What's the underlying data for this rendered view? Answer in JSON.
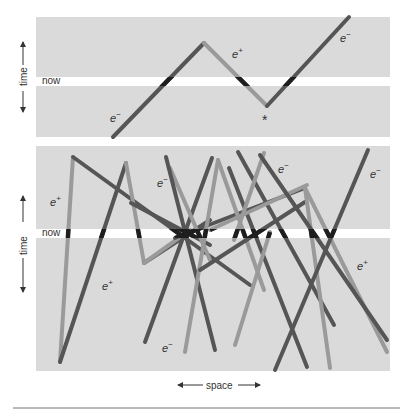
{
  "colors": {
    "panel_bg": "#dadada",
    "now_band": "#ffffff",
    "electron": "#555555",
    "positron": "#9a9a9a",
    "highlight": "#1e1e1e",
    "text": "#333333",
    "rule": "#777777"
  },
  "top_panel": {
    "axis_label": "time",
    "now_label": "now",
    "labels": [
      {
        "text": "e",
        "sup": "−",
        "x": 110,
        "y": 122
      },
      {
        "text": "e",
        "sup": "+",
        "x": 232,
        "y": 58
      },
      {
        "text": "e",
        "sup": "−",
        "x": 340,
        "y": 42
      }
    ],
    "annotation_marker": "*",
    "paths": [
      {
        "type": "electron",
        "points": [
          [
            113,
            137
          ],
          [
            204,
            43
          ]
        ]
      },
      {
        "type": "positron",
        "points": [
          [
            204,
            43
          ],
          [
            267,
            106
          ]
        ]
      },
      {
        "type": "electron",
        "points": [
          [
            267,
            106
          ],
          [
            349,
            17
          ]
        ]
      }
    ]
  },
  "bottom_panel": {
    "axis_label": "time",
    "now_label": "now",
    "labels": [
      {
        "text": "e",
        "sup": "+",
        "x": 50,
        "y": 206
      },
      {
        "text": "e",
        "sup": "−",
        "x": 157,
        "y": 187
      },
      {
        "text": "e",
        "sup": "−",
        "x": 278,
        "y": 173
      },
      {
        "text": "e",
        "sup": "−",
        "x": 370,
        "y": 178
      },
      {
        "text": "e",
        "sup": "+",
        "x": 102,
        "y": 290
      },
      {
        "text": "e",
        "sup": "+",
        "x": 357,
        "y": 270
      },
      {
        "text": "e",
        "sup": "−",
        "x": 162,
        "y": 352
      }
    ],
    "paths": [
      {
        "type": "positron",
        "points": [
          [
            60,
            362
          ],
          [
            73,
            157
          ]
        ]
      },
      {
        "type": "electron",
        "points": [
          [
            73,
            157
          ],
          [
            250,
            285
          ]
        ]
      },
      {
        "type": "electron",
        "points": [
          [
            60,
            362
          ],
          [
            126,
            163
          ]
        ]
      },
      {
        "type": "positron",
        "points": [
          [
            126,
            163
          ],
          [
            144,
            263
          ]
        ]
      },
      {
        "type": "electron",
        "points": [
          [
            144,
            263
          ],
          [
            210,
            220
          ]
        ]
      },
      {
        "type": "positron",
        "points": [
          [
            144,
            263
          ],
          [
            190,
            230
          ]
        ]
      },
      {
        "type": "electron",
        "points": [
          [
            131,
            203
          ],
          [
            210,
            245
          ]
        ]
      },
      {
        "type": "electron",
        "points": [
          [
            175,
            238
          ],
          [
            305,
            188
          ]
        ]
      },
      {
        "type": "electron",
        "points": [
          [
            145,
            342
          ],
          [
            212,
            158
          ]
        ]
      },
      {
        "type": "positron",
        "points": [
          [
            170,
            168
          ],
          [
            210,
            260
          ]
        ]
      },
      {
        "type": "electron",
        "points": [
          [
            166,
            157
          ],
          [
            215,
            350
          ]
        ]
      },
      {
        "type": "positron",
        "points": [
          [
            185,
            352
          ],
          [
            218,
            160
          ]
        ]
      },
      {
        "type": "electron",
        "points": [
          [
            238,
            152
          ],
          [
            334,
            325
          ]
        ]
      },
      {
        "type": "positron",
        "points": [
          [
            218,
            160
          ],
          [
            264,
            290
          ]
        ]
      },
      {
        "type": "electron",
        "points": [
          [
            229,
            168
          ],
          [
            307,
            367
          ]
        ]
      },
      {
        "type": "positron",
        "points": [
          [
            210,
            230
          ],
          [
            307,
            185
          ]
        ]
      },
      {
        "type": "positron",
        "points": [
          [
            234,
            240
          ],
          [
            264,
            153
          ]
        ]
      },
      {
        "type": "positron",
        "points": [
          [
            235,
            345
          ],
          [
            270,
            232
          ]
        ]
      },
      {
        "type": "electron",
        "points": [
          [
            200,
            270
          ],
          [
            305,
            202
          ]
        ]
      },
      {
        "type": "positron",
        "points": [
          [
            305,
            188
          ],
          [
            330,
            368
          ]
        ]
      },
      {
        "type": "positron",
        "points": [
          [
            305,
            188
          ],
          [
            387,
            352
          ]
        ]
      },
      {
        "type": "electron",
        "points": [
          [
            260,
            155
          ],
          [
            387,
            340
          ]
        ]
      },
      {
        "type": "electron",
        "points": [
          [
            275,
            370
          ],
          [
            368,
            150
          ]
        ]
      }
    ]
  },
  "x_axis": {
    "label": "space"
  }
}
